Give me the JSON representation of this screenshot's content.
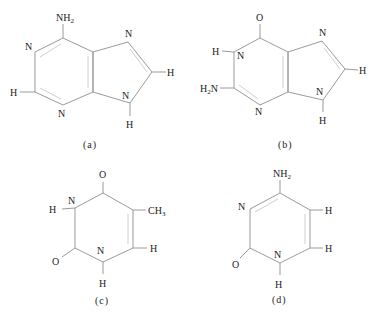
{
  "figure": {
    "structures": [
      {
        "id": "a",
        "caption": "(a)",
        "fill": "#ababab",
        "labels": {
          "nh2": "NH",
          "nh2_sub": "2",
          "n1": "N",
          "h2": "H",
          "n3": "N",
          "n7": "N",
          "h8": "H",
          "n9": "N",
          "h9": "H"
        }
      },
      {
        "id": "b",
        "caption": "(b)",
        "fill": "#ababab",
        "labels": {
          "o6": "O",
          "h1": "H",
          "n1": "N",
          "h2n": "H",
          "h2n_sub": "2",
          "h2n_n": "N",
          "n3": "N",
          "n7": "N",
          "h8": "H",
          "n9": "N",
          "h9": "H"
        }
      },
      {
        "id": "c",
        "caption": "(c)",
        "fill": "#b5b5b5",
        "labels": {
          "o4": "O",
          "n3": "N",
          "h3": "H",
          "ch3": "CH",
          "ch3_sub": "3",
          "h6": "H",
          "n1": "N",
          "h1": "H",
          "o2": "O"
        }
      },
      {
        "id": "d",
        "caption": "(d)",
        "fill": "#c6c6c6",
        "labels": {
          "nh2": "NH",
          "nh2_sub": "2",
          "n3": "N",
          "h5": "H",
          "h6": "H",
          "n1": "N",
          "h1": "H",
          "o2": "O"
        }
      }
    ]
  }
}
